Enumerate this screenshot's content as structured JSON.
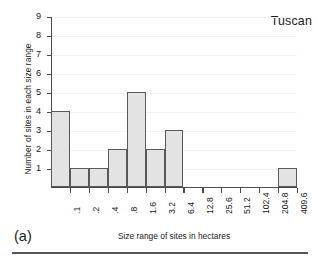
{
  "chart_data": {
    "type": "bar",
    "title": "Tuscan",
    "xlabel": "Size range of sites in hectares",
    "ylabel": "Number of sites in each size range",
    "panel_label": "(a)",
    "grid": true,
    "legend": "none",
    "ylim": [
      0,
      9
    ],
    "ytick_labels": [
      "1",
      "2",
      "3",
      "4",
      "5",
      "6",
      "7",
      "8",
      "9"
    ],
    "ytick_values": [
      1,
      2,
      3,
      4,
      5,
      6,
      7,
      8,
      9
    ],
    "xtick_labels": [
      ".1",
      ".2",
      ".4",
      ".8",
      "1.6",
      "3.2",
      "6.4",
      "12.8",
      "25.6",
      "51.2",
      "102.4",
      "204.8",
      "409.6"
    ],
    "bin_edges_note": "bars span between successive tick labels; first bar spans from y-axis to .1",
    "categories": [
      "<.1",
      ".1-.2",
      ".2-.4",
      ".4-.8",
      ".8-1.6",
      "1.6-3.2",
      "3.2-6.4",
      "6.4-12.8",
      "12.8-25.6",
      "25.6-51.2",
      "51.2-102.4",
      "102.4-204.8",
      "204.8-409.6"
    ],
    "values": [
      4,
      1,
      1,
      2,
      5,
      2,
      3,
      0,
      0,
      0,
      0,
      0,
      1
    ],
    "colors": {
      "bar_fill": "#e3e3e3",
      "bar_edge": "#595959",
      "axis": "#4c4c4c",
      "grid": "#f2f2f2",
      "text": "#1b1b1b"
    }
  }
}
